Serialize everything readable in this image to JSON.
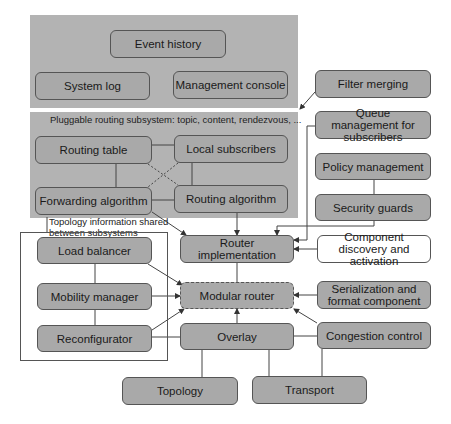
{
  "diagram": {
    "top_panel": {
      "event_history": "Event history",
      "system_log": "System log",
      "management_console": "Management console"
    },
    "routing_panel": {
      "title": "Pluggable routing subsystem: topic, content, rendezvous, ...",
      "routing_table": "Routing table",
      "local_subscribers": "Local subscribers",
      "forwarding_algorithm": "Forwarding algorithm",
      "routing_algorithm": "Routing algorithm"
    },
    "right_column": {
      "filter_merging": "Filter merging",
      "queue_management": "Queue management for subscribers",
      "policy_management": "Policy management",
      "security_guards": "Security guards",
      "component_discovery": "Component discovery and activation",
      "serialization": "Serialization and format component",
      "congestion_control": "Congestion control"
    },
    "topology_group": {
      "label_line1": "Topology information shared",
      "label_line2": "between subsystems",
      "load_balancer": "Load balancer",
      "mobility_manager": "Mobility manager",
      "reconfigurator": "Reconfigurator"
    },
    "center": {
      "router_implementation": "Router implementation",
      "modular_router": "Modular router",
      "overlay": "Overlay"
    },
    "bottom": {
      "topology": "Topology",
      "transport": "Transport"
    },
    "colors": {
      "panel": "#b3b3b3",
      "box": "#a9a9a9",
      "border": "#555555"
    }
  }
}
